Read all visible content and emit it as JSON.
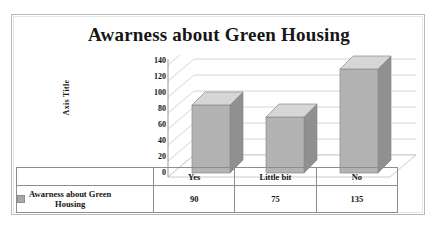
{
  "chart_data": {
    "type": "bar",
    "title": "Awarness about Green Housing",
    "xlabel": "",
    "ylabel": "Axis Title",
    "categories": [
      "Yes",
      "Little bit",
      "No"
    ],
    "values": [
      90,
      75,
      135
    ],
    "series": [
      {
        "name": "Awarness about Green Housing",
        "values": [
          90,
          75,
          135
        ]
      }
    ],
    "ylim": [
      0,
      140
    ],
    "yticks": [
      140,
      120,
      100,
      80,
      60,
      40,
      20,
      0
    ],
    "ytick_labels": [
      "140",
      "120",
      "100",
      "80",
      "60",
      "40",
      "20",
      "0"
    ],
    "grid": true,
    "legend_position": "data-table",
    "legend_entries": [
      "Awarness about Green Housing"
    ],
    "style": "3d-column",
    "data_table_visible": true,
    "colors": {
      "bar_front": "#b3b3b3",
      "bar_top": "#d6d6d6",
      "bar_side": "#909090",
      "gridline": "#c9c9c9",
      "axis": "#8d8d8d",
      "frame": "#b9b9b9",
      "text": "#161616",
      "legend_swatch": "#a8a8a8"
    }
  },
  "legend": {
    "label_line1": "Awarness about Green",
    "label_line2": "Housing",
    "swatch_name": "series-color-swatch"
  }
}
